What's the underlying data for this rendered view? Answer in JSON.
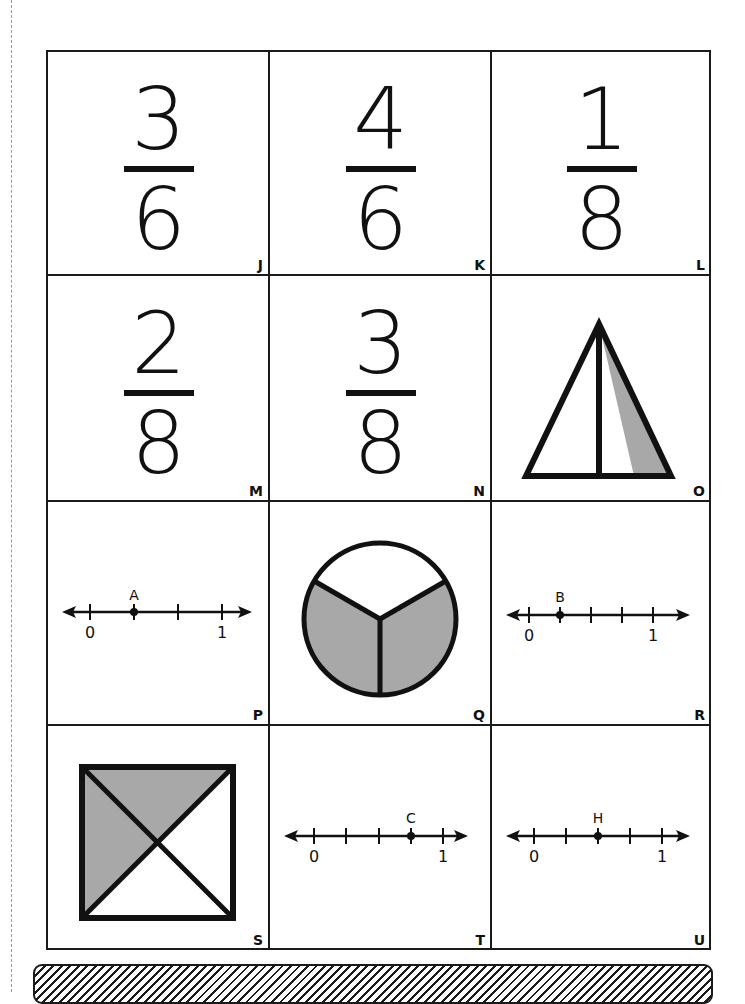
{
  "page": {
    "type": "fraction-cards-worksheet",
    "shade_color": "#a8a8a8",
    "line_color": "#1a1a1a"
  },
  "cards": [
    {
      "letter": "J",
      "kind": "fraction",
      "numerator": "3",
      "denominator": "6"
    },
    {
      "letter": "K",
      "kind": "fraction",
      "numerator": "4",
      "denominator": "6"
    },
    {
      "letter": "L",
      "kind": "fraction",
      "numerator": "1",
      "denominator": "8"
    },
    {
      "letter": "M",
      "kind": "fraction",
      "numerator": "2",
      "denominator": "8"
    },
    {
      "letter": "N",
      "kind": "fraction",
      "numerator": "3",
      "denominator": "8"
    },
    {
      "letter": "O",
      "kind": "shape",
      "shape": "triangle",
      "parts": 2,
      "shaded": 1
    },
    {
      "letter": "P",
      "kind": "number-line",
      "divisions": 3,
      "point_label": "A",
      "point_at": 1,
      "start_label": "0",
      "end_label": "1"
    },
    {
      "letter": "Q",
      "kind": "shape",
      "shape": "circle",
      "parts": 3,
      "shaded": 2
    },
    {
      "letter": "R",
      "kind": "number-line",
      "divisions": 4,
      "point_label": "B",
      "point_at": 1,
      "start_label": "0",
      "end_label": "1"
    },
    {
      "letter": "S",
      "kind": "shape",
      "shape": "square",
      "parts": 4,
      "shaded": 2
    },
    {
      "letter": "T",
      "kind": "number-line",
      "divisions": 4,
      "point_label": "C",
      "point_at": 3,
      "start_label": "0",
      "end_label": "1"
    },
    {
      "letter": "U",
      "kind": "number-line",
      "divisions": 4,
      "point_label": "H",
      "point_at": 2,
      "start_label": "0",
      "end_label": "1"
    }
  ]
}
